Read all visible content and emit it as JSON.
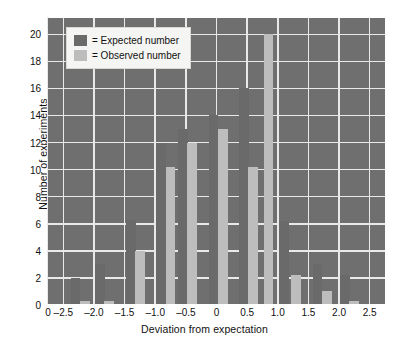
{
  "chart_data": {
    "type": "bar",
    "title": "",
    "xlabel": "Deviation from expectation",
    "ylabel": "Number of experiments",
    "xlim": [
      -2.75,
      2.75
    ],
    "ylim": [
      0,
      21.2
    ],
    "xticks": [
      "0",
      "–2.5",
      "–2.0",
      "–1.5",
      "–1.0",
      "–0.5",
      "0",
      "0.5",
      "1.0",
      "1.5",
      "2.0",
      "2.5"
    ],
    "xtick_values": [
      -2.75,
      -2.5,
      -2.0,
      -1.5,
      -1.0,
      -0.5,
      0,
      0.5,
      1.0,
      1.5,
      2.0,
      2.5
    ],
    "yticks": [
      "0",
      "2",
      "4",
      "6",
      "8",
      "10",
      "12",
      "14",
      "16",
      "18",
      "20"
    ],
    "ytick_values": [
      0,
      2,
      4,
      6,
      8,
      10,
      12,
      14,
      16,
      18,
      20
    ],
    "grid": true,
    "legend_position": "upper-left",
    "bar_width": 0.16,
    "series": [
      {
        "name": "Expected number",
        "color": "#6a6a6a",
        "x": [
          -2.3,
          -1.9,
          -1.4,
          -0.9,
          -0.55,
          -0.05,
          0.45,
          1.1,
          1.65,
          2.1
        ],
        "values": [
          2,
          3,
          6.3,
          12,
          13,
          14,
          16,
          6.2,
          3,
          2.2
        ]
      },
      {
        "name": "Observed number",
        "color": "#bdbdbd",
        "x": [
          -2.15,
          -1.75,
          -1.25,
          -0.75,
          -0.4,
          0.1,
          0.6,
          0.85,
          1.3,
          1.8,
          2.25
        ],
        "values": [
          0.3,
          0.3,
          4,
          10.2,
          12,
          13,
          10.2,
          20,
          2.2,
          1,
          0.3
        ]
      }
    ]
  },
  "legend": {
    "items": [
      {
        "swatch": "expected-swatch",
        "label": "= Expected number"
      },
      {
        "swatch": "observed-swatch",
        "label": "= Observed number"
      }
    ]
  },
  "axes": {
    "y_title": "Number of experiments",
    "x_title": "Deviation from expectation"
  },
  "colors": {
    "plot_background": "#6f6f6f",
    "expected_bar": "#6a6a6a",
    "observed_bar": "#bdbdbd",
    "gridline": "#e9e9e9",
    "text": "#111111"
  }
}
